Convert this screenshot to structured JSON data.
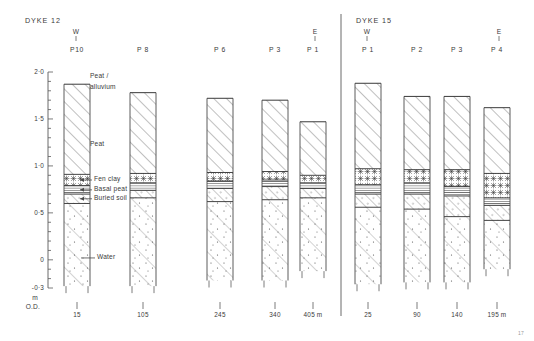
{
  "figure": {
    "kind": "stratigraphic-cross-section",
    "figure_number": "17",
    "vertical_axis": {
      "unit_caption_line1": "m",
      "unit_caption_line2": "O.D.",
      "ticks": [
        {
          "label": "2·0",
          "value": 2.0
        },
        {
          "label": "1·5",
          "value": 1.5
        },
        {
          "label": "1·0",
          "value": 1.0
        },
        {
          "label": "0·5",
          "value": 0.5
        },
        {
          "label": "0",
          "value": 0.0
        },
        {
          "label": "-0·3",
          "value": -0.3
        }
      ],
      "minor_tick_step": 0.1,
      "range": [
        -0.3,
        2.0
      ]
    },
    "legend": [
      {
        "key": "peat_alluvium",
        "label": "Peat /",
        "label2": "alluvium",
        "style": "diagonal-hatch"
      },
      {
        "key": "peat",
        "label": "Peat",
        "style": "diagonal-hatch"
      },
      {
        "key": "fen_clay",
        "label": "Fen clay",
        "style": "cross-star"
      },
      {
        "key": "basal_peat",
        "label": "Basal peat",
        "style": "fine-horizontal"
      },
      {
        "key": "buried_soil",
        "label": "Buried soil",
        "style": "dotted-hatch"
      },
      {
        "key": "water",
        "label": "Water",
        "style": "sparse-dots"
      }
    ],
    "panels": [
      {
        "id": "dyke-12",
        "title": "DYKE 12",
        "west_marker": "W",
        "east_marker": "E",
        "columns": [
          {
            "name": "P10",
            "distance": "15",
            "top": 1.87,
            "base": -0.28,
            "layers": [
              {
                "unit": "peat_alluvium",
                "from": 1.87,
                "to": 1.47
              },
              {
                "unit": "peat",
                "from": 1.47,
                "to": 0.91
              },
              {
                "unit": "fen_clay",
                "from": 0.91,
                "to": 0.79
              },
              {
                "unit": "basal_peat",
                "from": 0.79,
                "to": 0.7
              },
              {
                "unit": "buried_soil",
                "from": 0.7,
                "to": 0.6
              },
              {
                "unit": "water",
                "from": 0.6,
                "to": -0.28
              }
            ]
          },
          {
            "name": "P 8",
            "distance": "105",
            "top": 1.78,
            "base": -0.28,
            "layers": [
              {
                "unit": "peat_alluvium",
                "from": 1.78,
                "to": 1.3
              },
              {
                "unit": "peat",
                "from": 1.3,
                "to": 0.92
              },
              {
                "unit": "fen_clay",
                "from": 0.92,
                "to": 0.82
              },
              {
                "unit": "basal_peat",
                "from": 0.82,
                "to": 0.74
              },
              {
                "unit": "buried_soil",
                "from": 0.74,
                "to": 0.66
              },
              {
                "unit": "water",
                "from": 0.66,
                "to": -0.28
              }
            ]
          },
          {
            "name": "P 6",
            "distance": "245",
            "top": 1.72,
            "base": -0.22,
            "layers": [
              {
                "unit": "peat_alluvium",
                "from": 1.72,
                "to": 1.2
              },
              {
                "unit": "peat",
                "from": 1.2,
                "to": 0.93
              },
              {
                "unit": "fen_clay",
                "from": 0.93,
                "to": 0.84
              },
              {
                "unit": "basal_peat",
                "from": 0.84,
                "to": 0.76
              },
              {
                "unit": "buried_soil",
                "from": 0.76,
                "to": 0.62
              },
              {
                "unit": "water",
                "from": 0.62,
                "to": -0.22
              }
            ]
          },
          {
            "name": "P 3",
            "distance": "340",
            "top": 1.7,
            "base": -0.22,
            "layers": [
              {
                "unit": "peat_alluvium",
                "from": 1.7,
                "to": 1.16
              },
              {
                "unit": "peat",
                "from": 1.16,
                "to": 0.94
              },
              {
                "unit": "fen_clay",
                "from": 0.94,
                "to": 0.85
              },
              {
                "unit": "basal_peat",
                "from": 0.85,
                "to": 0.78
              },
              {
                "unit": "buried_soil",
                "from": 0.78,
                "to": 0.64
              },
              {
                "unit": "water",
                "from": 0.64,
                "to": -0.22
              }
            ]
          },
          {
            "name": "P 1",
            "distance": "405 m",
            "top": 1.47,
            "base": -0.12,
            "layers": [
              {
                "unit": "peat_alluvium",
                "from": 1.47,
                "to": 1.02
              },
              {
                "unit": "peat",
                "from": 1.02,
                "to": 0.9
              },
              {
                "unit": "fen_clay",
                "from": 0.9,
                "to": 0.82
              },
              {
                "unit": "basal_peat",
                "from": 0.82,
                "to": 0.76
              },
              {
                "unit": "buried_soil",
                "from": 0.76,
                "to": 0.66
              },
              {
                "unit": "water",
                "from": 0.66,
                "to": -0.12
              }
            ]
          }
        ]
      },
      {
        "id": "dyke-15",
        "title": "DYKE 15",
        "west_marker": "W",
        "east_marker": "E",
        "columns": [
          {
            "name": "P 1",
            "distance": "25",
            "top": 1.88,
            "base": -0.26,
            "layers": [
              {
                "unit": "peat_alluvium",
                "from": 1.88,
                "to": 1.32
              },
              {
                "unit": "peat",
                "from": 1.32,
                "to": 0.97
              },
              {
                "unit": "fen_clay",
                "from": 0.97,
                "to": 0.8
              },
              {
                "unit": "basal_peat",
                "from": 0.8,
                "to": 0.7
              },
              {
                "unit": "buried_soil",
                "from": 0.7,
                "to": 0.56
              },
              {
                "unit": "water",
                "from": 0.56,
                "to": -0.26
              }
            ]
          },
          {
            "name": "P 2",
            "distance": "90",
            "top": 1.74,
            "base": -0.24,
            "layers": [
              {
                "unit": "peat_alluvium",
                "from": 1.74,
                "to": 1.22
              },
              {
                "unit": "peat",
                "from": 1.22,
                "to": 0.96
              },
              {
                "unit": "fen_clay",
                "from": 0.96,
                "to": 0.82
              },
              {
                "unit": "basal_peat",
                "from": 0.82,
                "to": 0.7
              },
              {
                "unit": "buried_soil",
                "from": 0.7,
                "to": 0.54
              },
              {
                "unit": "water",
                "from": 0.54,
                "to": -0.24
              }
            ]
          },
          {
            "name": "P 3",
            "distance": "140",
            "top": 1.74,
            "base": -0.24,
            "layers": [
              {
                "unit": "peat_alluvium",
                "from": 1.74,
                "to": 1.24
              },
              {
                "unit": "peat",
                "from": 1.24,
                "to": 0.96
              },
              {
                "unit": "fen_clay",
                "from": 0.96,
                "to": 0.78
              },
              {
                "unit": "basal_peat",
                "from": 0.78,
                "to": 0.68
              },
              {
                "unit": "buried_soil",
                "from": 0.68,
                "to": 0.46
              },
              {
                "unit": "water",
                "from": 0.46,
                "to": -0.24
              }
            ]
          },
          {
            "name": "P 4",
            "distance": "195 m",
            "top": 1.62,
            "base": -0.1,
            "layers": [
              {
                "unit": "peat_alluvium",
                "from": 1.62,
                "to": 1.12
              },
              {
                "unit": "peat",
                "from": 1.12,
                "to": 0.92
              },
              {
                "unit": "fen_clay",
                "from": 0.92,
                "to": 0.66
              },
              {
                "unit": "basal_peat",
                "from": 0.66,
                "to": 0.58
              },
              {
                "unit": "buried_soil",
                "from": 0.58,
                "to": 0.42
              },
              {
                "unit": "water",
                "from": 0.42,
                "to": -0.1
              }
            ]
          }
        ]
      }
    ],
    "colors": {
      "ink": "#3a3a3a",
      "rule": "#555555",
      "background": "#ffffff"
    }
  }
}
